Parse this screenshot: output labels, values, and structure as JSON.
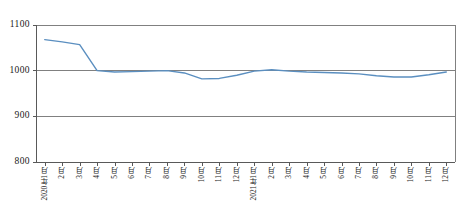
{
  "chart_data": {
    "type": "line",
    "title": "",
    "subtitle": "",
    "xlabel": "",
    "ylabel": "",
    "ylim": [
      800,
      1100
    ],
    "yticks": [
      800,
      900,
      1000,
      1100
    ],
    "grid": true,
    "grid_axis": "y",
    "legend": false,
    "legend_position": "none",
    "line_color": "#5b8fc0",
    "axis_color": "#595959",
    "grid_color": "#808080",
    "categories": [
      "2020年1月",
      "2月",
      "3月",
      "4月",
      "5月",
      "6月",
      "7月",
      "8月",
      "9月",
      "10月",
      "11月",
      "12月",
      "2021年1月",
      "2月",
      "3月",
      "4月",
      "5月",
      "6月",
      "7月",
      "8月",
      "9月",
      "10月",
      "11月",
      "12月"
    ],
    "series": [
      {
        "name": "指数",
        "values": [
          1068,
          1063,
          1057,
          1000,
          997,
          998,
          999,
          1000,
          995,
          982,
          983,
          990,
          999,
          1002,
          999,
          997,
          996,
          995,
          993,
          989,
          986,
          986,
          991,
          997
        ]
      }
    ]
  }
}
